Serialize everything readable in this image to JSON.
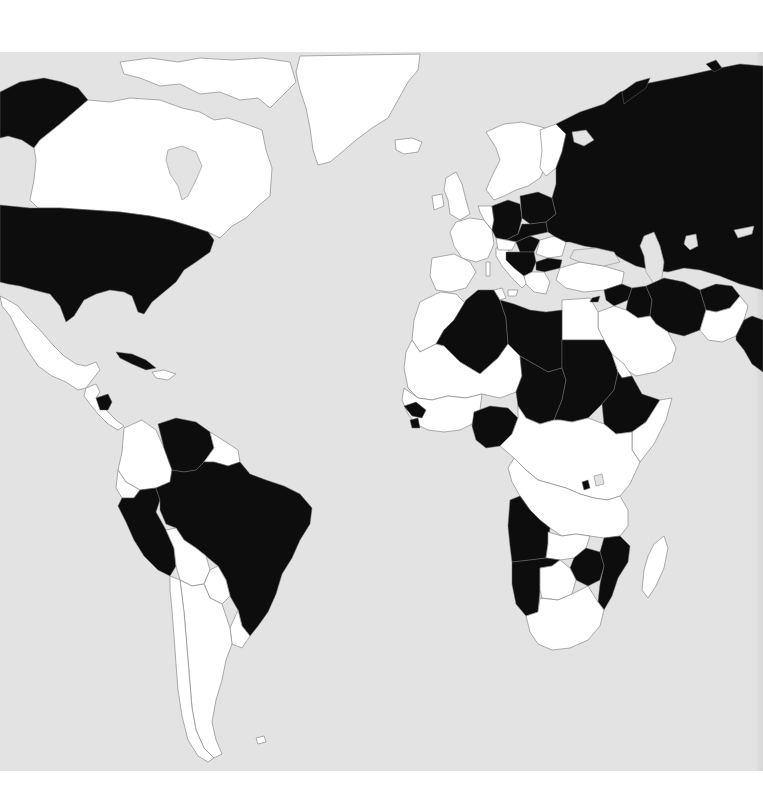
{
  "map": {
    "projection": "world political map (Americas, Europe, Africa, western/central Asia)",
    "colors": {
      "ocean": "#e3e3e3",
      "highlighted_country": "#0d0d0d",
      "other_country": "#ffffff",
      "border": "#8a8a8a",
      "page_margin": "#ffffff"
    },
    "legend": [],
    "highlighted_countries": {
      "north_america": [
        "Alaska (USA)",
        "United States",
        "Cuba",
        "Nicaragua"
      ],
      "south_america": [
        "Venezuela",
        "Peru",
        "Brazil"
      ],
      "europe": [
        "East Germany",
        "West Germany",
        "Poland",
        "Czechoslovakia",
        "Hungary",
        "Yugoslavia",
        "Bulgaria",
        "USSR"
      ],
      "middle_east_asia": [
        "Syria",
        "Iraq",
        "Iran",
        "Afghanistan",
        "India"
      ],
      "africa": [
        "Algeria",
        "Libya",
        "Chad",
        "Sudan",
        "Ethiopia",
        "Nigeria",
        "Guinea",
        "Sierra Leone",
        "Rwanda",
        "Angola",
        "Namibia",
        "Zimbabwe",
        "Mozambique"
      ]
    },
    "text_labels": []
  }
}
